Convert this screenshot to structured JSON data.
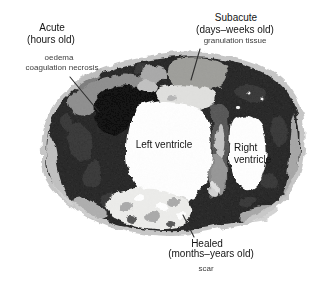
{
  "figure": {
    "description_labels": {
      "acute": {
        "title": "Acute",
        "subtitle": "(hours old)",
        "detail_line1": "oedema",
        "detail_line2": "coagulation necrosis"
      },
      "subacute": {
        "title": "Subacute",
        "subtitle": "(days–weeks old)",
        "detail_line1": "granulation tissue"
      },
      "healed": {
        "title": "Healed",
        "subtitle": "(months–years old)",
        "detail_line1": "scar"
      },
      "left_ventricle": "Left ventricle",
      "right_ventricle_line1": "Right",
      "right_ventricle_line2": "ventricle"
    },
    "colors": {
      "background": "#ffffff",
      "rim": "#c6c6c6",
      "myocardium_dark": "#242424",
      "necrotic_black": "#0b0b0b",
      "acute_band_gray": "#8d8d8d",
      "granulation_tissue": "#9d9d99",
      "pale_patch": "#e0e0de",
      "cavity_white": "#ffffff",
      "scar_light": "#ededeb",
      "leader_line": "#2f2f2f"
    }
  }
}
